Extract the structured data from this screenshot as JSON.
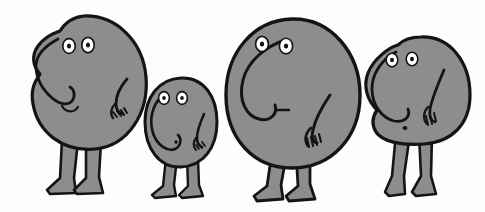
{
  "artwork": {
    "title": "Four Grey Blob Creatures",
    "medium": "ink-and-grey-wash cartoon drawing",
    "background_color": "#fdfdfd",
    "body_fill_color": "#8d8d8d",
    "outline_color": "#141414",
    "eye_white_color": "#ffffff",
    "figure_count": "4",
    "canvas": {
      "width": "485",
      "height": "212"
    }
  },
  "figures": [
    {
      "id": "figure-1",
      "label": "Tall rounded blob, far left",
      "size": "large",
      "body_shape": "egg",
      "eyes": "2",
      "nose": "long drooping trunk on left side",
      "mouth": "small curved frown",
      "arms": "1 visible right arm with fingered hand",
      "legs": "2 straight legs with splayed flat feet"
    },
    {
      "id": "figure-2",
      "label": "Small blob, second from left",
      "size": "small",
      "body_shape": "oval",
      "eyes": "2",
      "nose": "big looping trunk curling left",
      "mouth": "tiny dot",
      "arms": "1 short right arm with fingered hand",
      "legs": "2 thin legs with small feet"
    },
    {
      "id": "figure-3",
      "label": "Largest round blob, centre right",
      "size": "extra-large",
      "body_shape": "circle",
      "eyes": "2",
      "nose": "long sweeping trunk curving down and left",
      "mouth": "short horizontal dash",
      "arms": "1 long right arm with fingered hand",
      "legs": "2 short legs with pointed feet"
    },
    {
      "id": "figure-4",
      "label": "Blob with long legs, far right",
      "size": "medium",
      "body_shape": "rounded-square",
      "eyes": "2",
      "nose": "bulging rounded trunk on left",
      "mouth": "small dot",
      "arms": "1 right arm with fingered hand",
      "legs": "2 long slim legs with flat feet"
    }
  ]
}
